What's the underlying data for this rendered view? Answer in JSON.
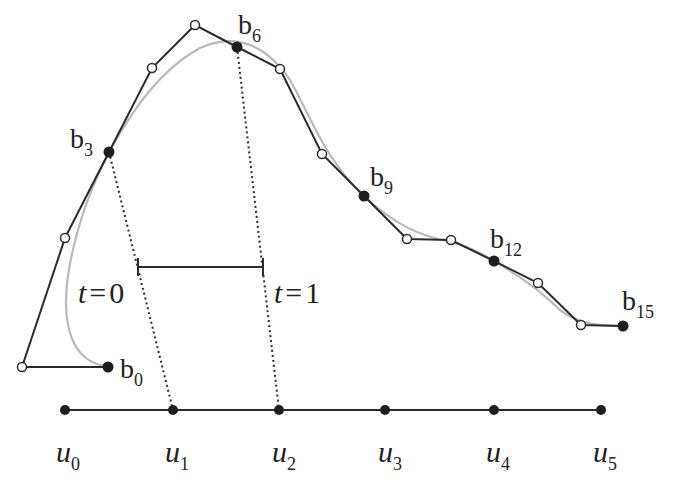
{
  "figure": {
    "colors": {
      "polygon": "#2a2a2a",
      "curve": "#b8b8b8",
      "filled_point": "#1e1e1e",
      "open_point_fill": "#ffffff",
      "dotted": "#2a2a2a",
      "background": "#ffffff"
    },
    "control_points": [
      {
        "id": "p0",
        "x": 108,
        "y": 367,
        "type": "filled",
        "label": "b",
        "sub": "0"
      },
      {
        "id": "p1",
        "x": 22,
        "y": 367,
        "type": "open"
      },
      {
        "id": "p2",
        "x": 65,
        "y": 238,
        "type": "open"
      },
      {
        "id": "p3",
        "x": 109,
        "y": 152,
        "type": "filled",
        "label": "b",
        "sub": "3"
      },
      {
        "id": "p4",
        "x": 152,
        "y": 68,
        "type": "open"
      },
      {
        "id": "p5",
        "x": 195,
        "y": 25,
        "type": "open"
      },
      {
        "id": "p6",
        "x": 237,
        "y": 47,
        "type": "filled",
        "label": "b",
        "sub": "6"
      },
      {
        "id": "p7",
        "x": 280,
        "y": 69,
        "type": "open"
      },
      {
        "id": "p8",
        "x": 322,
        "y": 154,
        "type": "open"
      },
      {
        "id": "p9",
        "x": 364,
        "y": 196,
        "type": "filled",
        "label": "b",
        "sub": "9"
      },
      {
        "id": "p10",
        "x": 407,
        "y": 239,
        "type": "open"
      },
      {
        "id": "p11",
        "x": 451,
        "y": 240,
        "type": "open"
      },
      {
        "id": "p12",
        "x": 494,
        "y": 261,
        "type": "filled",
        "label": "b",
        "sub": "12"
      },
      {
        "id": "p13",
        "x": 538,
        "y": 283,
        "type": "open"
      },
      {
        "id": "p14",
        "x": 581,
        "y": 325,
        "type": "open"
      },
      {
        "id": "p15",
        "x": 623,
        "y": 326,
        "type": "filled",
        "label": "b",
        "sub": "15"
      }
    ],
    "point_labels": {
      "b0": {
        "text": "b",
        "sub": "0"
      },
      "b3": {
        "text": "b",
        "sub": "3"
      },
      "b6": {
        "text": "b",
        "sub": "6"
      },
      "b9": {
        "text": "b",
        "sub": "9"
      },
      "b12": {
        "text": "b",
        "sub": "12"
      },
      "b15": {
        "text": "b",
        "sub": "15"
      }
    },
    "knots": {
      "line_y": 410,
      "items": [
        {
          "x": 65,
          "label": "u",
          "sub": "0"
        },
        {
          "x": 173,
          "label": "u",
          "sub": "1"
        },
        {
          "x": 279,
          "label": "u",
          "sub": "2"
        },
        {
          "x": 385,
          "label": "u",
          "sub": "3"
        },
        {
          "x": 494,
          "label": "u",
          "sub": "4"
        },
        {
          "x": 601,
          "label": "u",
          "sub": "5"
        }
      ]
    },
    "knot_labels": {
      "u0": {
        "text": "u",
        "sub": "0"
      },
      "u1": {
        "text": "u",
        "sub": "1"
      },
      "u2": {
        "text": "u",
        "sub": "2"
      },
      "u3": {
        "text": "u",
        "sub": "3"
      },
      "u4": {
        "text": "u",
        "sub": "4"
      },
      "u5": {
        "text": "u",
        "sub": "5"
      }
    },
    "local_interval": {
      "x_start": 138,
      "x_end": 263,
      "y": 267,
      "label_start": "t = 0",
      "label_end": "t = 1",
      "t_symbol": "t",
      "equals": "=",
      "start_value": "0",
      "end_value": "1"
    }
  }
}
